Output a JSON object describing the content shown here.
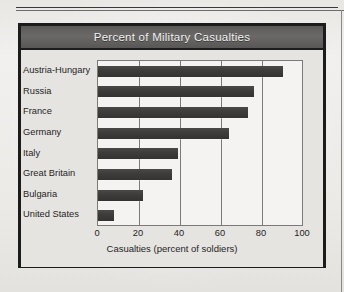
{
  "page": {
    "background_color": "#efeeec",
    "rule_color": "#3a3a3a"
  },
  "chart_card": {
    "border_color": "#1c1c1c",
    "panel_color": "#e6e4e1",
    "title_bar_color": "#5f5e5c",
    "title": "Percent of Military Casualties"
  },
  "chart_data": {
    "type": "bar",
    "orientation": "horizontal",
    "title": "Percent of Military Casualties",
    "xlabel": "Casualties (percent of soldiers)",
    "ylabel": "",
    "xlim": [
      0,
      100
    ],
    "xticks": [
      0,
      20,
      40,
      60,
      80,
      100
    ],
    "xtick_labels": [
      "0",
      "20",
      "40",
      "60",
      "80",
      "100"
    ],
    "grid": "vertical",
    "legend": "none",
    "bar_color": "#3e3d3b",
    "plot_background": "#f4f3f1",
    "categories": [
      "Austria-Hungary",
      "Russia",
      "France",
      "Germany",
      "Italy",
      "Great Britain",
      "Bulgaria",
      "United States"
    ],
    "values": [
      90,
      76,
      73,
      64,
      39,
      36,
      22,
      8
    ]
  }
}
